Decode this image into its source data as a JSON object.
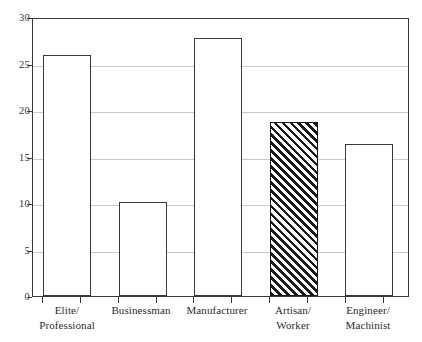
{
  "chart_data": {
    "type": "bar",
    "title": "",
    "xlabel": "",
    "ylabel": "",
    "ylim": [
      0,
      30
    ],
    "grid": true,
    "legend": "none",
    "categories": [
      "Elite/ Professional",
      "Businessman",
      "Manufacturer",
      "Artisan/ Worker",
      "Engineer/ Machinist"
    ],
    "values": [
      26.1,
      10.2,
      27.9,
      18.8,
      16.5
    ],
    "yticks": [
      0,
      5,
      10,
      15,
      20,
      25,
      30
    ],
    "ytick_labels": [
      "0",
      "5",
      "10",
      "15",
      "20",
      "25",
      "30"
    ],
    "bar_styles": [
      "open",
      "open",
      "open",
      "hatched",
      "open"
    ],
    "colors": {
      "bar_fill": "#ffffff",
      "bar_edge": "#3a3a3a",
      "hatch": "#1a1a1a",
      "gridline": "#c9c9c9",
      "axis": "#3a3a3a",
      "text": "#2b2b2b",
      "background": "#ffffff"
    }
  },
  "axes": {
    "y": {
      "ticks": [
        {
          "label": "30",
          "value": 30
        },
        {
          "label": "25",
          "value": 25
        },
        {
          "label": "20",
          "value": 20
        },
        {
          "label": "15",
          "value": 15
        },
        {
          "label": "10",
          "value": 10
        },
        {
          "label": "5",
          "value": 5
        },
        {
          "label": "0",
          "value": 0
        }
      ]
    },
    "x": {
      "categories": [
        {
          "line1": "Elite/",
          "line2": "Professional"
        },
        {
          "line1": "Businessman",
          "line2": ""
        },
        {
          "line1": "Manufacturer",
          "line2": ""
        },
        {
          "line1": "Artisan/",
          "line2": "Worker"
        },
        {
          "line1": "Engineer/",
          "line2": "Machinist"
        }
      ]
    }
  },
  "bars": [
    {
      "name": "bar-elite-professional",
      "value": 26.1,
      "style": "open"
    },
    {
      "name": "bar-businessman",
      "value": 10.2,
      "style": "open"
    },
    {
      "name": "bar-manufacturer",
      "value": 27.9,
      "style": "open"
    },
    {
      "name": "bar-artisan-worker",
      "value": 18.8,
      "style": "hatched"
    },
    {
      "name": "bar-engineer-machinist",
      "value": 16.5,
      "style": "open"
    }
  ]
}
